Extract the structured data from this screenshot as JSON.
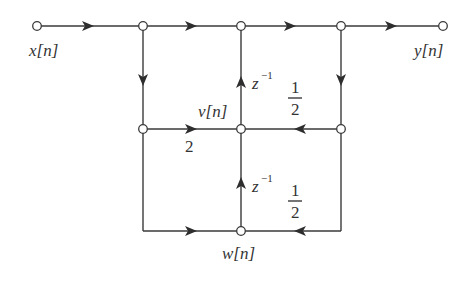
{
  "diagram": {
    "type": "signal-flow-graph",
    "nodes": [
      {
        "id": "x",
        "x": 37,
        "y": 26
      },
      {
        "id": "a",
        "x": 143,
        "y": 26
      },
      {
        "id": "b",
        "x": 241,
        "y": 26
      },
      {
        "id": "c",
        "x": 341,
        "y": 26
      },
      {
        "id": "y",
        "x": 443,
        "y": 26
      },
      {
        "id": "d",
        "x": 143,
        "y": 129
      },
      {
        "id": "v",
        "x": 241,
        "y": 129
      },
      {
        "id": "e",
        "x": 341,
        "y": 129
      },
      {
        "id": "w",
        "x": 241,
        "y": 231
      }
    ],
    "labels": {
      "input": "x[n]",
      "output": "y[n]",
      "v": "v[n]",
      "w": "w[n]",
      "delay_base": "z",
      "delay_exp": "−1",
      "gain_two": "2",
      "half_num": "1",
      "half_den": "2"
    },
    "edges": [
      {
        "from": "x",
        "to": "a",
        "gain": ""
      },
      {
        "from": "a",
        "to": "b",
        "gain": ""
      },
      {
        "from": "b",
        "to": "c",
        "gain": ""
      },
      {
        "from": "c",
        "to": "y",
        "gain": ""
      },
      {
        "from": "a",
        "to": "d",
        "gain": ""
      },
      {
        "from": "d",
        "to": "v",
        "gain": "2"
      },
      {
        "from": "v",
        "to": "b",
        "gain": "z^-1"
      },
      {
        "from": "c",
        "to": "e",
        "gain": ""
      },
      {
        "from": "e",
        "to": "v",
        "gain": "1/2"
      },
      {
        "from": "d",
        "to": "w",
        "gain": ""
      },
      {
        "from": "w",
        "to": "v",
        "gain": "z^-1"
      },
      {
        "from": "e",
        "to": "w",
        "gain": "1/2"
      }
    ]
  }
}
